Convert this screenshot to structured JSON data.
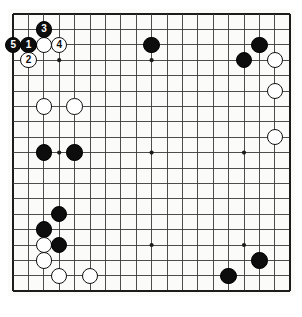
{
  "figure": {
    "kind": "go-board-diagram",
    "board_size": 19,
    "background_color": "#ffffff",
    "board_color": "#fbfbfa",
    "line_color": "#3a3a3a",
    "edge_color": "#1c1c1c",
    "black_color": "#0d0d0d",
    "white_color": "#ffffff"
  },
  "geometry": {
    "origin_x": 13,
    "origin_y": 14,
    "spacing": 15.4,
    "stone_diameter": 16.5,
    "star_radius": 2.1,
    "board_pad": 5
  },
  "star_points": [
    {
      "col": 3,
      "row": 3
    },
    {
      "col": 9,
      "row": 3
    },
    {
      "col": 15,
      "row": 3
    },
    {
      "col": 3,
      "row": 9
    },
    {
      "col": 9,
      "row": 9
    },
    {
      "col": 15,
      "row": 9
    },
    {
      "col": 3,
      "row": 15
    },
    {
      "col": 9,
      "row": 15
    },
    {
      "col": 15,
      "row": 15
    }
  ],
  "stones": [
    {
      "id": "b-k17",
      "color": "black",
      "col": 9,
      "row": 2,
      "label": ""
    },
    {
      "id": "b-q17",
      "color": "black",
      "col": 16,
      "row": 2,
      "label": ""
    },
    {
      "id": "b-o16",
      "color": "black",
      "col": 15,
      "row": 3,
      "label": ""
    },
    {
      "id": "w-r16",
      "color": "white",
      "col": 17,
      "row": 3,
      "label": ""
    },
    {
      "id": "w-r14",
      "color": "white",
      "col": 17,
      "row": 5,
      "label": ""
    },
    {
      "id": "w-r11",
      "color": "white",
      "col": 17,
      "row": 8,
      "label": ""
    },
    {
      "id": "w-c13",
      "color": "white",
      "col": 2,
      "row": 6,
      "label": ""
    },
    {
      "id": "w-e13",
      "color": "white",
      "col": 4,
      "row": 6,
      "label": ""
    },
    {
      "id": "b-c10",
      "color": "black",
      "col": 2,
      "row": 9,
      "label": ""
    },
    {
      "id": "b-e10",
      "color": "black",
      "col": 4,
      "row": 9,
      "label": ""
    },
    {
      "id": "b-d6",
      "color": "black",
      "col": 3,
      "row": 13,
      "label": ""
    },
    {
      "id": "b-c5",
      "color": "black",
      "col": 2,
      "row": 14,
      "label": ""
    },
    {
      "id": "w-c4",
      "color": "white",
      "col": 2,
      "row": 15,
      "label": ""
    },
    {
      "id": "b-d4",
      "color": "black",
      "col": 3,
      "row": 15,
      "label": ""
    },
    {
      "id": "w-c3",
      "color": "white",
      "col": 2,
      "row": 16,
      "label": ""
    },
    {
      "id": "w-d2",
      "color": "white",
      "col": 3,
      "row": 17,
      "label": ""
    },
    {
      "id": "w-g2",
      "color": "white",
      "col": 5,
      "row": 17,
      "label": ""
    },
    {
      "id": "b-q3",
      "color": "black",
      "col": 16,
      "row": 16,
      "label": ""
    },
    {
      "id": "b-n2",
      "color": "black",
      "col": 14,
      "row": 17,
      "label": ""
    }
  ],
  "move_stones": [
    {
      "id": "move-5",
      "color": "black",
      "col": 0,
      "row": 2,
      "label": "5"
    },
    {
      "id": "move-1",
      "color": "black",
      "col": 1,
      "row": 2,
      "label": "1"
    },
    {
      "id": "move-3",
      "color": "black",
      "col": 2,
      "row": 1,
      "label": "3"
    },
    {
      "id": "move-4",
      "color": "white",
      "col": 3,
      "row": 2,
      "label": "4"
    },
    {
      "id": "move-2",
      "color": "white",
      "col": 1,
      "row": 3,
      "label": "2"
    },
    {
      "id": "stone-c17",
      "color": "white",
      "col": 2,
      "row": 2,
      "label": ""
    }
  ]
}
